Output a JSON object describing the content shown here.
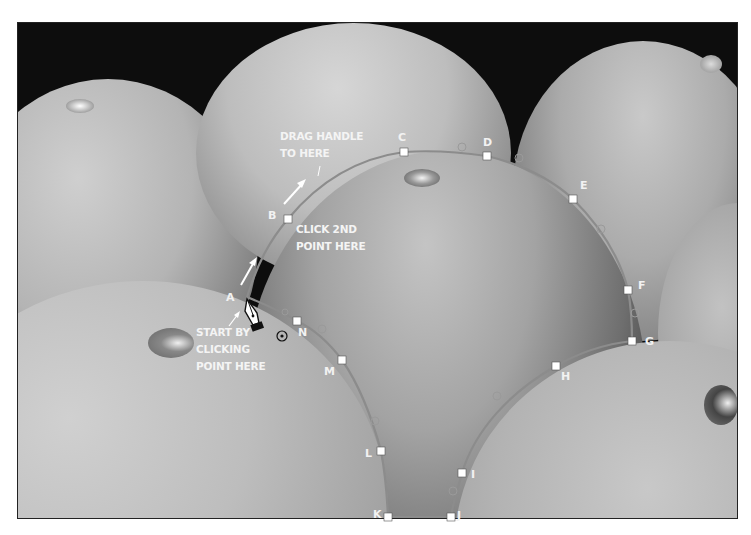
{
  "figure": {
    "background_color": "#0d0d0d",
    "path_color": "#8a8a8a",
    "anchor_color": "#ffffff"
  },
  "annotations": {
    "drag_handle": [
      "DRAG HANDLE",
      "TO HERE"
    ],
    "click_2nd": [
      "CLICK 2ND",
      "POINT HERE"
    ],
    "start": [
      "START BY",
      "CLICKING",
      "POINT HERE"
    ]
  },
  "anchors": [
    {
      "label": "A",
      "x": 247,
      "y": 297
    },
    {
      "label": "B",
      "x": 288,
      "y": 219
    },
    {
      "label": "C",
      "x": 404,
      "y": 152
    },
    {
      "label": "D",
      "x": 487,
      "y": 156
    },
    {
      "label": "E",
      "x": 573,
      "y": 199
    },
    {
      "label": "F",
      "x": 628,
      "y": 290
    },
    {
      "label": "G",
      "x": 632,
      "y": 341
    },
    {
      "label": "H",
      "x": 556,
      "y": 366
    },
    {
      "label": "I",
      "x": 462,
      "y": 473
    },
    {
      "label": "J",
      "x": 451,
      "y": 517
    },
    {
      "label": "K",
      "x": 388,
      "y": 517
    },
    {
      "label": "L",
      "x": 381,
      "y": 451
    },
    {
      "label": "M",
      "x": 342,
      "y": 360
    },
    {
      "label": "N",
      "x": 297,
      "y": 321
    }
  ],
  "tool": {
    "icon": "pen-tool-icon"
  }
}
